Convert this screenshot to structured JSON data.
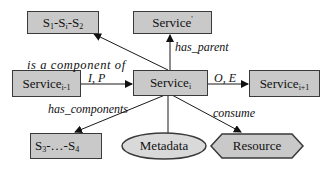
{
  "diagram": {
    "nodes": {
      "s1_si_s2": {
        "base": "S",
        "parts": [
          {
            "t": "S",
            "sub": "1"
          },
          {
            "t": "-S",
            "sub": "i"
          },
          {
            "t": "-S",
            "sub": "2"
          }
        ],
        "label": "S1-Si-S2"
      },
      "service_parent": {
        "text": "Service",
        "sup": "'",
        "label": "Service'"
      },
      "service_prev": {
        "text": "Service",
        "sub": "i-1",
        "label": "Service i-1"
      },
      "service_i": {
        "text": "Service",
        "sub": "i",
        "label": "Service i"
      },
      "service_next": {
        "text": "Service",
        "sub": "i+1",
        "label": "Service i+1"
      },
      "s3_s4": {
        "label": "S3-...-S4",
        "p1": "S",
        "sub1": "3",
        "mid": "-…-S",
        "sub2": "4"
      },
      "metadata": {
        "label": "Metadata"
      },
      "resource": {
        "label": "Resource"
      }
    },
    "edges": {
      "is_component_of": "is a component of",
      "has_parent": "has_parent",
      "input": "I, P",
      "output": "O, E",
      "has_components": "has_components",
      "consume": "consume"
    },
    "colors": {
      "node_fill": "#c9c9c9",
      "node_stroke": "#3a3a3a",
      "ellipse_fill": "#d9d9d9",
      "edge": "#1a1a1a"
    }
  }
}
